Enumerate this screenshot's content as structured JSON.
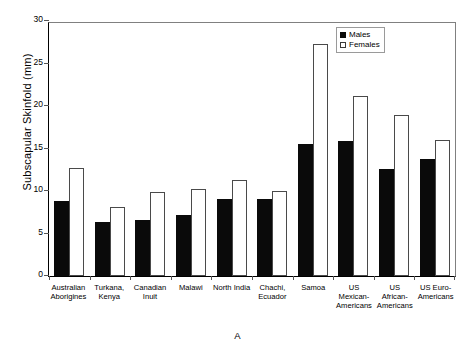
{
  "chart_data": {
    "type": "bar",
    "title": "",
    "xlabel": "",
    "ylabel": "Subscapular Skinfold (mm)",
    "ylim": [
      0,
      30
    ],
    "yticks": [
      0,
      5,
      10,
      15,
      20,
      25,
      30
    ],
    "grid": false,
    "legend_position": "top-right",
    "panel_label": "A",
    "categories": [
      "Australian Aborigines",
      "Turkana, Kenya",
      "Canadian Inuit",
      "Malawi",
      "North India",
      "Chachi, Ecuador",
      "Samoa",
      "US Mexican-Americans",
      "US African-Americans",
      "US Euro-Americans"
    ],
    "category_lines": [
      [
        "Australian",
        "Aborigines"
      ],
      [
        "Turkana,",
        "Kenya"
      ],
      [
        "Canadian",
        "Inuit"
      ],
      [
        "Malawi"
      ],
      [
        "North India"
      ],
      [
        "Chachi,",
        "Ecuador"
      ],
      [
        "Samoa"
      ],
      [
        "US",
        "Mexican-",
        "Americans"
      ],
      [
        "US",
        "African-",
        "Americans"
      ],
      [
        "US Euro-",
        "Americans"
      ]
    ],
    "series": [
      {
        "name": "Males",
        "color": "#0a0a0a",
        "values": [
          8.8,
          6.4,
          6.6,
          7.2,
          9.1,
          9.1,
          15.5,
          15.9,
          12.6,
          13.8
        ]
      },
      {
        "name": "Females",
        "color": "#ffffff",
        "values": [
          12.7,
          8.1,
          9.9,
          10.2,
          11.3,
          10.0,
          27.3,
          21.2,
          19.0,
          16.0
        ]
      }
    ]
  },
  "legend": {
    "items": [
      {
        "label": "Males",
        "style": "filled"
      },
      {
        "label": "Females",
        "style": "open"
      }
    ]
  },
  "caption": {
    "text": "A"
  }
}
